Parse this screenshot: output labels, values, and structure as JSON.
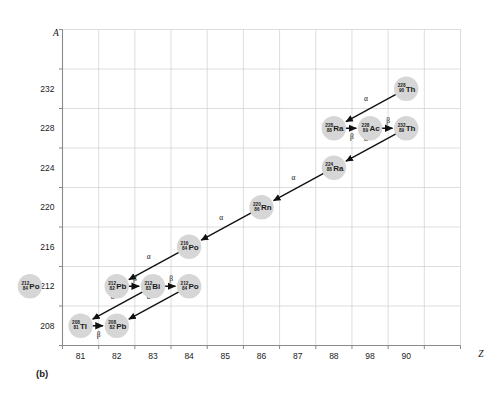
{
  "caption": "(b)",
  "axes": {
    "y_title": "A",
    "x_title": "Z",
    "y_ticks": [
      "232",
      "228",
      "224",
      "220",
      "216",
      "212",
      "208"
    ],
    "x_ticks": [
      "81",
      "82",
      "83",
      "84",
      "85",
      "86",
      "87",
      "88",
      "98",
      "90"
    ]
  },
  "chart_data": {
    "type": "scatter",
    "title": "",
    "xlabel": "Z",
    "ylabel": "A",
    "xlim": [
      80.5,
      91.5
    ],
    "ylim": [
      205.5,
      234.5
    ],
    "grid": true,
    "legend": "none",
    "x_tick_values": [
      81,
      82,
      83,
      84,
      85,
      86,
      87,
      88,
      89,
      90
    ],
    "x_tick_labels": [
      "81",
      "82",
      "83",
      "84",
      "85",
      "86",
      "87",
      "88",
      "98",
      "90"
    ],
    "y_tick_values": [
      232,
      228,
      224,
      220,
      216,
      212,
      208
    ],
    "y_tick_labels": [
      "232",
      "228",
      "224",
      "220",
      "216",
      "212",
      "208"
    ],
    "nodes": [
      {
        "id": "th232",
        "mass": "228",
        "atomic": "90",
        "symbol": "Th",
        "Z": 90,
        "A": 232,
        "clipped": false
      },
      {
        "id": "ra228",
        "mass": "228",
        "atomic": "88",
        "symbol": "Ra",
        "Z": 88,
        "A": 228,
        "clipped": false
      },
      {
        "id": "ac228",
        "mass": "228",
        "atomic": "89",
        "symbol": "Ac",
        "Z": 89,
        "A": 228,
        "clipped": false
      },
      {
        "id": "th228",
        "mass": "232",
        "atomic": "89",
        "symbol": "Th",
        "Z": 90,
        "A": 228,
        "clipped": false
      },
      {
        "id": "ra224",
        "mass": "224",
        "atomic": "88",
        "symbol": "Ra",
        "Z": 88,
        "A": 224,
        "clipped": false
      },
      {
        "id": "rn220",
        "mass": "220",
        "atomic": "86",
        "symbol": "Rn",
        "Z": 86,
        "A": 220,
        "clipped": false
      },
      {
        "id": "po216",
        "mass": "216",
        "atomic": "84",
        "symbol": "Po",
        "Z": 84,
        "A": 216,
        "clipped": false
      },
      {
        "id": "pb212",
        "mass": "212",
        "atomic": "82",
        "symbol": "Pb",
        "Z": 82,
        "A": 212,
        "clipped": false
      },
      {
        "id": "bi212",
        "mass": "212",
        "atomic": "83",
        "symbol": "Bi",
        "Z": 83,
        "A": 212,
        "clipped": false
      },
      {
        "id": "po212",
        "mass": "212",
        "atomic": "84",
        "symbol": "Po",
        "Z": 84,
        "A": 212,
        "clipped": false
      },
      {
        "id": "tl208",
        "mass": "208",
        "atomic": "81",
        "symbol": "Tl",
        "Z": 81,
        "A": 208,
        "clipped": false
      },
      {
        "id": "pb208",
        "mass": "208",
        "atomic": "82",
        "symbol": "Pb",
        "Z": 82,
        "A": 208,
        "clipped": false
      },
      {
        "id": "po212edge",
        "mass": "212",
        "atomic": "84",
        "symbol": "Po",
        "Z": 79.6,
        "A": 212,
        "clipped": true
      }
    ],
    "transitions": [
      {
        "from": "th232",
        "to": "ra228",
        "type": "alpha",
        "label": "α"
      },
      {
        "from": "ra228",
        "to": "ac228",
        "type": "beta",
        "label": "β"
      },
      {
        "from": "ac228",
        "to": "th228",
        "type": "beta",
        "label": "β"
      },
      {
        "from": "th228",
        "to": "ra224",
        "type": "alpha",
        "label": "α"
      },
      {
        "from": "ra224",
        "to": "rn220",
        "type": "alpha",
        "label": "α"
      },
      {
        "from": "rn220",
        "to": "po216",
        "type": "alpha",
        "label": "α"
      },
      {
        "from": "po216",
        "to": "pb212",
        "type": "alpha",
        "label": "α"
      },
      {
        "from": "pb212",
        "to": "bi212",
        "type": "beta",
        "label": "β"
      },
      {
        "from": "bi212",
        "to": "po212",
        "type": "beta",
        "label": "β"
      },
      {
        "from": "bi212",
        "to": "tl208",
        "type": "alpha",
        "label": "α"
      },
      {
        "from": "po212",
        "to": "pb208",
        "type": "alpha",
        "label": "α"
      },
      {
        "from": "tl208",
        "to": "pb208",
        "type": "beta",
        "label": "β"
      }
    ]
  }
}
